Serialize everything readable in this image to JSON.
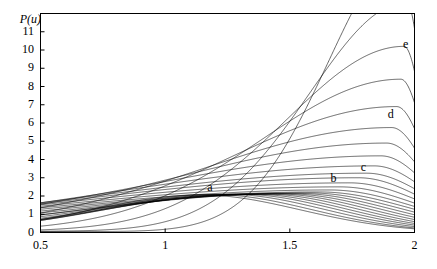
{
  "chart_data": {
    "type": "line",
    "title": "",
    "xlabel": "",
    "ylabel": "P(u)",
    "xlim": [
      0.5,
      2.0
    ],
    "ylim": [
      0,
      12
    ],
    "grid": false,
    "legend": "none",
    "x_ticks": [
      {
        "value": 0.5,
        "label": "0.5"
      },
      {
        "value": 1.0,
        "label": "1"
      },
      {
        "value": 1.5,
        "label": "1.5"
      },
      {
        "value": 2.0,
        "label": "2"
      }
    ],
    "y_ticks": [
      {
        "value": 0,
        "label": "0"
      },
      {
        "value": 1,
        "label": "1"
      },
      {
        "value": 2,
        "label": "2"
      },
      {
        "value": 3,
        "label": "3"
      },
      {
        "value": 4,
        "label": "4"
      },
      {
        "value": 5,
        "label": "5"
      },
      {
        "value": 6,
        "label": "6"
      },
      {
        "value": 7,
        "label": "7"
      },
      {
        "value": 8,
        "label": "8"
      },
      {
        "value": 9,
        "label": "9"
      },
      {
        "value": 10,
        "label": "10"
      },
      {
        "value": 11,
        "label": "11"
      }
    ],
    "annotations": [
      {
        "text": "a",
        "x": 1.18,
        "y": 2.45
      },
      {
        "text": "b",
        "x": 1.675,
        "y": 2.95
      },
      {
        "text": "c",
        "x": 1.795,
        "y": 3.55
      },
      {
        "text": "d",
        "x": 1.905,
        "y": 6.45
      },
      {
        "text": "e",
        "x": 1.965,
        "y": 10.25
      }
    ],
    "line_color": "#000000",
    "line_width": 0.6,
    "series_note": "family of unimodal probability densities P(u) on u in [0.5,2]; peaks migrate right and grow taller",
    "series": [
      {
        "name": "1",
        "peak_x": 1.15,
        "peak_y": 2.02
      },
      {
        "name": "2",
        "peak_x": 1.2,
        "peak_y": 2.05
      },
      {
        "name": "3",
        "peak_x": 1.255,
        "peak_y": 2.07
      },
      {
        "name": "4",
        "peak_x": 1.305,
        "peak_y": 2.08
      },
      {
        "name": "5",
        "peak_x": 1.35,
        "peak_y": 2.09
      },
      {
        "name": "6",
        "peak_x": 1.395,
        "peak_y": 2.1
      },
      {
        "name": "7",
        "peak_x": 1.44,
        "peak_y": 2.11
      },
      {
        "name": "8",
        "peak_x": 1.485,
        "peak_y": 2.12
      },
      {
        "name": "9",
        "peak_x": 1.53,
        "peak_y": 2.14
      },
      {
        "name": "10",
        "peak_x": 1.575,
        "peak_y": 2.17
      },
      {
        "name": "11",
        "peak_x": 1.62,
        "peak_y": 2.22
      },
      {
        "name": "12",
        "peak_x": 1.66,
        "peak_y": 2.33
      },
      {
        "name": "13",
        "peak_x": 1.7,
        "peak_y": 2.5
      },
      {
        "name": "14",
        "peak_x": 1.74,
        "peak_y": 2.72
      },
      {
        "name": "15",
        "peak_x": 1.775,
        "peak_y": 3.0
      },
      {
        "name": "16",
        "peak_x": 1.808,
        "peak_y": 3.25
      },
      {
        "name": "17",
        "peak_x": 1.838,
        "peak_y": 3.65
      },
      {
        "name": "18",
        "peak_x": 1.865,
        "peak_y": 4.2
      },
      {
        "name": "19",
        "peak_x": 1.888,
        "peak_y": 4.9
      },
      {
        "name": "20",
        "peak_x": 1.908,
        "peak_y": 5.75
      },
      {
        "name": "21",
        "peak_x": 1.928,
        "peak_y": 6.9
      },
      {
        "name": "22",
        "peak_x": 1.945,
        "peak_y": 8.4
      },
      {
        "name": "23",
        "peak_x": 1.958,
        "peak_y": 10.2
      },
      {
        "name": "24",
        "peak_x": 1.969,
        "peak_y": 12.6
      },
      {
        "name": "25",
        "peak_x": 1.978,
        "peak_y": 15.5
      }
    ]
  },
  "figure": {
    "frame_color": "#000000",
    "background": "#ffffff"
  }
}
